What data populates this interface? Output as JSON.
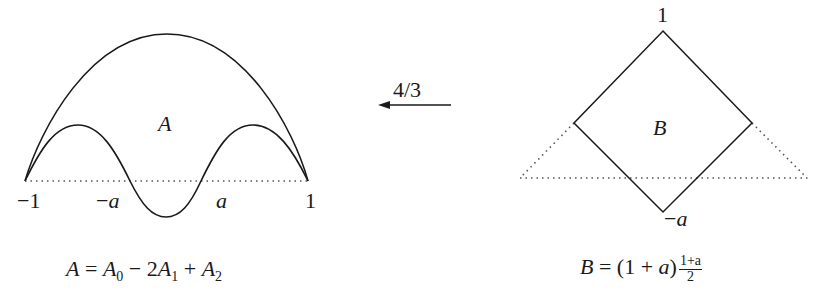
{
  "left_figure": {
    "region_label": "A",
    "axis_labels": {
      "left_end": "−1",
      "neg_a": "−a",
      "neg_a_sign": "−",
      "neg_a_var": "a",
      "pos_a": "a",
      "right_end": "1"
    },
    "equation": {
      "lhs": "A",
      "eq": " = ",
      "t0": "A",
      "t0_sub": "0",
      "op1": " − 2",
      "t1": "A",
      "t1_sub": "1",
      "op2": " + ",
      "t2": "A",
      "t2_sub": "2"
    }
  },
  "arrow": {
    "label": "4/3",
    "direction": "left"
  },
  "right_figure": {
    "region_label": "B",
    "top_label": "1",
    "bottom_label_sign": "−",
    "bottom_label_var": "a",
    "equation": {
      "lhs": "B",
      "eq": " = (1 + ",
      "var": "a",
      "close": ")",
      "frac_num": "1+a",
      "frac_den": "2"
    }
  },
  "colors": {
    "stroke": "#1a1a1a",
    "dotted": "#555555",
    "background": "#ffffff"
  }
}
